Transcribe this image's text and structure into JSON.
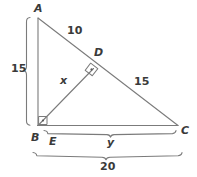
{
  "figure": {
    "type": "geometry-diagram",
    "stroke_color": "#7b7b7b",
    "text_color": "#3a3a3a",
    "background": "#ffffff",
    "vertices": {
      "a": "A",
      "b": "B",
      "c": "C",
      "d": "D",
      "e": "E"
    },
    "measures": {
      "ab": "15",
      "ad": "10",
      "dc": "15",
      "bd": "x",
      "ec": "y",
      "bc_total": "20"
    },
    "right_angles": [
      {
        "at": "B",
        "symbol": "square-dot"
      },
      {
        "at": "D",
        "symbol": "square-dot"
      }
    ],
    "brackets": [
      {
        "name": "left-bracket",
        "label": "15",
        "orientation": "vertical"
      },
      {
        "name": "bottom-inner-bracket",
        "label": "y",
        "orientation": "horizontal"
      },
      {
        "name": "bottom-outer-bracket",
        "label": "20",
        "orientation": "horizontal"
      }
    ]
  }
}
